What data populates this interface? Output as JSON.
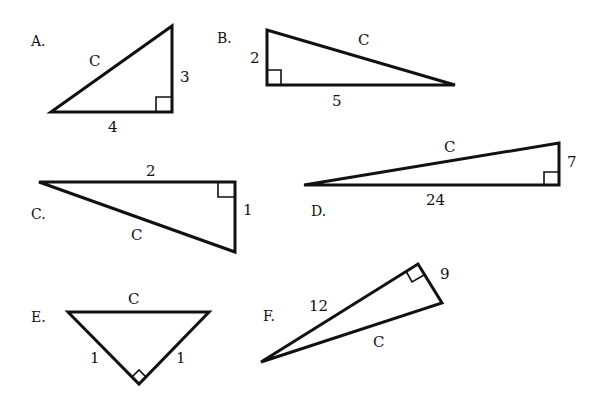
{
  "diagram": {
    "title": "",
    "triangles": [
      {
        "id": "A",
        "label": "A.",
        "legs": [
          "3",
          "4"
        ],
        "hypotenuse": "C",
        "sides": {
          "vertical": "3",
          "horizontal": "4",
          "slanted": "C"
        }
      },
      {
        "id": "B",
        "label": "B.",
        "legs": [
          "2",
          "5"
        ],
        "hypotenuse": "C",
        "sides": {
          "vertical": "2",
          "horizontal": "5",
          "slanted": "C"
        }
      },
      {
        "id": "C",
        "label": "C.",
        "legs": [
          "2",
          "1"
        ],
        "hypotenuse": "C",
        "sides": {
          "horizontal": "2",
          "vertical": "1",
          "slanted": "C"
        }
      },
      {
        "id": "D",
        "label": "D.",
        "legs": [
          "7",
          "24"
        ],
        "hypotenuse": "C",
        "sides": {
          "vertical": "7",
          "horizontal": "24",
          "slanted": "C"
        }
      },
      {
        "id": "E",
        "label": "E.",
        "legs": [
          "1",
          "1"
        ],
        "hypotenuse": "C",
        "sides": {
          "left": "1",
          "right": "1",
          "top": "C"
        }
      },
      {
        "id": "F",
        "label": "F.",
        "legs": [
          "12",
          "9"
        ],
        "hypotenuse": "C",
        "sides": {
          "long_leg": "12",
          "short_leg": "9",
          "slanted": "C"
        }
      }
    ],
    "colors": {
      "stroke": "#111111",
      "background": "#ffffff"
    }
  }
}
